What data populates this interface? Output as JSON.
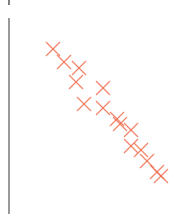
{
  "chart_data": {
    "type": "scatter",
    "title": "",
    "xlabel": "",
    "ylabel": "",
    "grid": false,
    "legend": null,
    "marker": "x",
    "marker_color": "#f07050",
    "axis_color": "#555555",
    "series": [
      {
        "name": "points",
        "points_px": [
          [
            53,
            49
          ],
          [
            64,
            62
          ],
          [
            79,
            68
          ],
          [
            76,
            82
          ],
          [
            103,
            88
          ],
          [
            84,
            104
          ],
          [
            103,
            108
          ],
          [
            117,
            119
          ],
          [
            120,
            124
          ],
          [
            131,
            130
          ],
          [
            131,
            146
          ],
          [
            141,
            150
          ],
          [
            147,
            161
          ],
          [
            157,
            172
          ],
          [
            161,
            176
          ]
        ]
      }
    ]
  }
}
